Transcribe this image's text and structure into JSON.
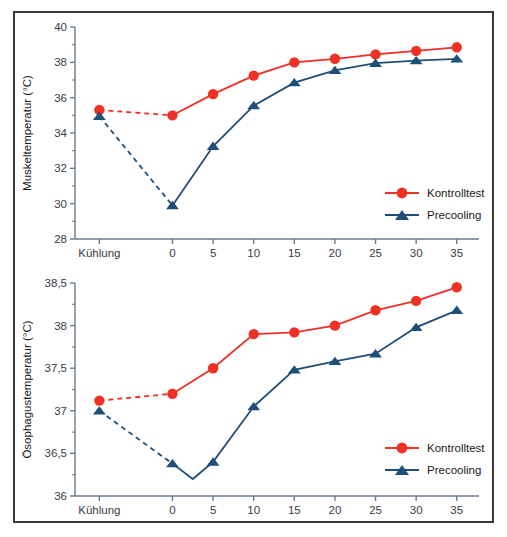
{
  "figure": {
    "border_color": "#3a3a3a",
    "background": "#ffffff"
  },
  "colors": {
    "control": "#ee3124",
    "precooling": "#1f4e79",
    "axis": "#6b7b8c",
    "tick_text": "#3a3a46",
    "title_text": "#1a1a1a"
  },
  "legend": {
    "control_label": "Kontrolltest",
    "precooling_label": "Precooling"
  },
  "chart_data": [
    {
      "type": "line",
      "id": "muskeltemperatur",
      "title": "",
      "ylabel": "Muskeltemperatur (°C)",
      "xlabel": "",
      "ylim": [
        28,
        40
      ],
      "yticks": [
        28,
        30,
        32,
        34,
        36,
        38,
        40
      ],
      "ytick_labels": [
        "28",
        "30",
        "32",
        "34",
        "36",
        "38",
        "40"
      ],
      "xticks": [
        "Kühlung",
        "0",
        "5",
        "10",
        "15",
        "20",
        "25",
        "30",
        "35"
      ],
      "x": [
        -9,
        0,
        5,
        10,
        15,
        20,
        25,
        30,
        35
      ],
      "grid": false,
      "legend_position": "lower-right",
      "series": [
        {
          "name": "Kontrolltest",
          "marker": "circle",
          "color": "#ee3124",
          "dashed_segment": [
            0,
            1
          ],
          "values": [
            35.3,
            35.0,
            36.2,
            37.25,
            38.0,
            38.2,
            38.45,
            38.65,
            38.85
          ]
        },
        {
          "name": "Precooling",
          "marker": "triangle",
          "color": "#1f4e79",
          "dashed_segment": [
            0,
            1
          ],
          "values": [
            34.95,
            29.9,
            33.25,
            35.55,
            36.85,
            37.55,
            37.95,
            38.1,
            38.2
          ]
        }
      ]
    },
    {
      "type": "line",
      "id": "oesophagustemperatur",
      "title": "",
      "ylabel": "Ösophagustemperatur (°C)",
      "xlabel": "",
      "ylim": [
        36,
        38.5
      ],
      "yticks": [
        36,
        36.5,
        37,
        37.5,
        38,
        38.5
      ],
      "ytick_labels": [
        "36",
        "36,5",
        "37",
        "37,5",
        "38",
        "38,5"
      ],
      "xticks": [
        "Kühlung",
        "0",
        "5",
        "10",
        "15",
        "20",
        "25",
        "30",
        "35"
      ],
      "x": [
        -9,
        0,
        5,
        10,
        15,
        20,
        25,
        30,
        35
      ],
      "grid": false,
      "legend_position": "lower-right",
      "series": [
        {
          "name": "Kontrolltest",
          "marker": "circle",
          "color": "#ee3124",
          "dashed_segment": [
            0,
            1
          ],
          "values": [
            37.12,
            37.2,
            37.5,
            37.9,
            37.92,
            38.0,
            38.18,
            38.29,
            38.45
          ]
        },
        {
          "name": "Precooling",
          "marker": "triangle",
          "color": "#1f4e79",
          "dashed_segment": [
            0,
            1
          ],
          "dip": {
            "x": 2.5,
            "value": 36.2
          },
          "values": [
            37.0,
            36.38,
            36.4,
            37.05,
            37.48,
            37.58,
            37.67,
            37.98,
            38.18
          ]
        }
      ]
    }
  ]
}
